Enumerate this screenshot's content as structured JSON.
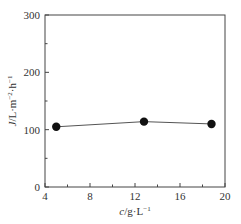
{
  "chart_data": {
    "type": "line",
    "title": "",
    "xlabel": "c/g·L⁻¹",
    "ylabel": "J/L·m⁻²·h⁻¹",
    "xlim": [
      4,
      20
    ],
    "ylim": [
      0,
      300
    ],
    "x_ticks": [
      4,
      8,
      12,
      16,
      20
    ],
    "x_minor_ticks": [
      6,
      10,
      14,
      18
    ],
    "y_ticks": [
      0,
      100,
      200,
      300
    ],
    "y_minor_ticks": [
      50,
      150,
      250
    ],
    "grid": false,
    "legend": null,
    "series": [
      {
        "name": "J",
        "marker": "filled-circle",
        "color": "#111111",
        "x": [
          5.0,
          12.8,
          18.8
        ],
        "values": [
          105,
          114,
          110
        ]
      }
    ]
  },
  "labels": {
    "x_ticks": [
      "4",
      "8",
      "12",
      "16",
      "20"
    ],
    "y_ticks": [
      "0",
      "100",
      "200",
      "300"
    ],
    "xlabel_var": "c",
    "xlabel_unit": "/g·L",
    "xlabel_exp": "−1",
    "ylabel_var": "J",
    "ylabel_unit": "/L·m",
    "ylabel_exp1": "−2",
    "ylabel_mid": "·h",
    "ylabel_exp2": "−1"
  }
}
